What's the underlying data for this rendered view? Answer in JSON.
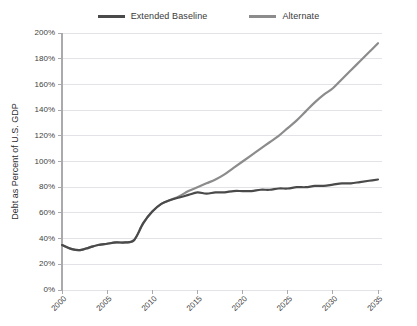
{
  "legend": {
    "position": "top-center",
    "entries": [
      {
        "label": "Extended Baseline",
        "color": "#4a4a4a",
        "icon": "line-swatch-icon"
      },
      {
        "label": "Alternate",
        "color": "#8c8c8c",
        "icon": "line-swatch-icon"
      }
    ]
  },
  "chart_data": {
    "type": "line",
    "title": "",
    "subtitle": "",
    "xlabel": "",
    "ylabel": "Debt as Percent of U.S. GDP",
    "xlim": [
      2000,
      2035
    ],
    "ylim": [
      0,
      200
    ],
    "grid": true,
    "xticks": [
      2000,
      2005,
      2010,
      2015,
      2020,
      2025,
      2030,
      2035
    ],
    "xticklabels": [
      "2000",
      "2005",
      "2010",
      "2015",
      "2020",
      "2025",
      "2030",
      "2035"
    ],
    "yticks": [
      0,
      20,
      40,
      60,
      80,
      100,
      120,
      140,
      160,
      180,
      200
    ],
    "yticklabels": [
      "0%",
      "20%",
      "40%",
      "60%",
      "80%",
      "100%",
      "120%",
      "140%",
      "160%",
      "180%",
      "200%"
    ],
    "x": [
      2000,
      2001,
      2002,
      2003,
      2004,
      2005,
      2006,
      2007,
      2008,
      2009,
      2010,
      2011,
      2012,
      2013,
      2014,
      2015,
      2016,
      2017,
      2018,
      2019,
      2020,
      2021,
      2022,
      2023,
      2024,
      2025,
      2026,
      2027,
      2028,
      2029,
      2030,
      2031,
      2032,
      2033,
      2034,
      2035
    ],
    "series": [
      {
        "name": "Extended Baseline",
        "color": "#4a4a4a",
        "values": [
          35,
          32,
          31,
          33,
          35,
          36,
          37,
          37,
          39,
          52,
          61,
          67,
          70,
          72,
          74,
          76,
          75,
          76,
          76,
          77,
          77,
          77,
          78,
          78,
          79,
          79,
          80,
          80,
          81,
          81,
          82,
          83,
          83,
          84,
          85,
          86
        ]
      },
      {
        "name": "Alternate",
        "color": "#8c8c8c",
        "values": [
          35,
          32,
          31,
          33,
          35,
          36,
          37,
          37,
          39,
          52,
          61,
          67,
          70,
          73,
          77,
          80,
          83,
          86,
          90,
          95,
          100,
          105,
          110,
          115,
          120,
          126,
          132,
          139,
          146,
          152,
          157,
          164,
          171,
          178,
          185,
          192
        ]
      }
    ]
  }
}
